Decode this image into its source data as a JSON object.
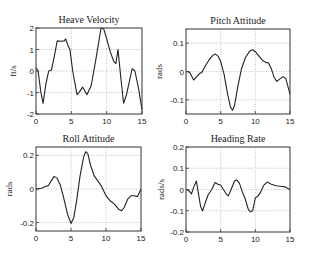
{
  "chart_data": [
    {
      "type": "line",
      "title": "Heave Velocity",
      "xlabel": "",
      "ylabel": "ft/s",
      "xlim": [
        0,
        15
      ],
      "ylim": [
        -2,
        2
      ],
      "xticks": [
        0,
        5,
        10,
        15
      ],
      "yticks": [
        -2,
        -1,
        0,
        1,
        2
      ],
      "grid": true,
      "box": {
        "left": 36,
        "top": 28,
        "right": 142,
        "bottom": 114
      },
      "x": [
        0,
        0.3,
        0.7,
        1.0,
        1.4,
        1.8,
        2.2,
        2.6,
        3.0,
        3.5,
        4.0,
        4.2,
        4.5,
        4.8,
        5.2,
        5.8,
        6.2,
        6.6,
        7.2,
        7.8,
        8.5,
        9.2,
        9.6,
        10.0,
        10.5,
        11.0,
        11.3,
        11.6,
        12.0,
        12.4,
        12.8,
        13.2,
        13.6,
        14.0,
        14.5,
        15.0
      ],
      "values": [
        0.15,
        0.0,
        -1.0,
        -1.5,
        -0.6,
        0.0,
        0.05,
        0.7,
        1.4,
        1.38,
        1.4,
        1.5,
        1.2,
        1.0,
        0.0,
        -1.1,
        -0.95,
        -0.75,
        -1.1,
        -0.7,
        0.6,
        2.0,
        1.95,
        1.5,
        0.9,
        0.45,
        0.35,
        1.0,
        -0.3,
        -1.5,
        -1.1,
        -0.5,
        0.1,
        0.0,
        -0.8,
        -1.8
      ],
      "series_color": "#222222"
    },
    {
      "type": "line",
      "title": "Pitch Attitude",
      "xlabel": "",
      "ylabel": "rads",
      "xlim": [
        0,
        15
      ],
      "ylim": [
        -0.15,
        0.15
      ],
      "xticks": [
        0,
        5,
        10,
        15
      ],
      "yticks": [
        -0.1,
        0,
        0.1
      ],
      "grid": true,
      "box": {
        "left": 186,
        "top": 29,
        "right": 290,
        "bottom": 114
      },
      "x": [
        0,
        0.5,
        0.8,
        1.1,
        1.5,
        1.9,
        2.3,
        2.8,
        3.3,
        3.8,
        4.2,
        4.6,
        5.0,
        5.5,
        6.0,
        6.4,
        6.7,
        7.0,
        7.5,
        8.0,
        8.6,
        9.2,
        9.6,
        10.0,
        10.5,
        11.0,
        11.5,
        11.9,
        12.3,
        12.7,
        13.1,
        13.6,
        14.0,
        14.4,
        15.0
      ],
      "values": [
        0.0,
        -0.002,
        -0.015,
        -0.03,
        -0.02,
        -0.008,
        -0.003,
        0.02,
        0.04,
        0.055,
        0.062,
        0.055,
        0.035,
        -0.01,
        -0.08,
        -0.125,
        -0.137,
        -0.12,
        -0.05,
        0.01,
        0.05,
        0.072,
        0.077,
        0.07,
        0.055,
        0.04,
        0.032,
        0.03,
        0.01,
        -0.02,
        -0.035,
        -0.025,
        -0.018,
        -0.025,
        -0.08
      ],
      "series_color": "#222222"
    },
    {
      "type": "line",
      "title": "Roll Attitude",
      "xlabel": "",
      "ylabel": "rads",
      "xlim": [
        0,
        15
      ],
      "ylim": [
        -0.25,
        0.25
      ],
      "xticks": [
        0,
        5,
        10,
        15
      ],
      "yticks": [
        -0.2,
        0,
        0.2
      ],
      "grid": true,
      "box": {
        "left": 36,
        "top": 147,
        "right": 141,
        "bottom": 231
      },
      "x": [
        0,
        0.8,
        1.3,
        1.8,
        2.2,
        2.6,
        3.0,
        3.5,
        4.0,
        4.5,
        5.0,
        5.4,
        5.8,
        6.3,
        6.8,
        7.1,
        7.4,
        7.8,
        8.3,
        8.8,
        9.3,
        10.0,
        10.6,
        11.2,
        11.8,
        12.2,
        12.6,
        13.1,
        13.6,
        14.0,
        14.5,
        15.0
      ],
      "values": [
        0.0,
        0.005,
        0.015,
        0.02,
        0.05,
        0.075,
        0.065,
        0.02,
        -0.06,
        -0.15,
        -0.205,
        -0.17,
        -0.07,
        0.08,
        0.19,
        0.222,
        0.21,
        0.14,
        0.08,
        0.05,
        0.02,
        -0.04,
        -0.07,
        -0.09,
        -0.12,
        -0.13,
        -0.11,
        -0.06,
        -0.04,
        -0.04,
        -0.045,
        0.0
      ],
      "series_color": "#222222"
    },
    {
      "type": "line",
      "title": "Heading Rate",
      "xlabel": "",
      "ylabel": "rads/s",
      "xlim": [
        0,
        15
      ],
      "ylim": [
        -0.2,
        0.2
      ],
      "xticks": [
        0,
        5,
        10,
        15
      ],
      "yticks": [
        -0.2,
        -0.1,
        0,
        0.1,
        0.2
      ],
      "grid": true,
      "box": {
        "left": 186,
        "top": 147,
        "right": 290,
        "bottom": 232
      },
      "x": [
        0,
        0.4,
        0.8,
        1.1,
        1.5,
        1.8,
        2.1,
        2.4,
        2.8,
        3.2,
        3.7,
        4.2,
        4.6,
        5.0,
        5.4,
        5.8,
        6.1,
        6.5,
        7.0,
        7.3,
        7.7,
        8.1,
        8.5,
        9.0,
        9.3,
        9.6,
        10.0,
        10.4,
        10.8,
        11.2,
        11.7,
        12.3,
        13.0,
        13.6,
        14.3,
        14.7,
        15.0
      ],
      "values": [
        0.0,
        -0.005,
        -0.02,
        0.01,
        0.04,
        -0.02,
        -0.08,
        -0.1,
        -0.06,
        -0.025,
        0.0,
        0.033,
        0.025,
        0.02,
        0.0,
        -0.02,
        -0.03,
        0.0,
        0.04,
        0.045,
        0.03,
        -0.01,
        -0.04,
        -0.095,
        -0.105,
        -0.1,
        -0.04,
        -0.03,
        -0.01,
        0.02,
        0.035,
        0.025,
        0.018,
        0.015,
        0.012,
        0.005,
        0.0
      ],
      "series_color": "#222222"
    }
  ]
}
